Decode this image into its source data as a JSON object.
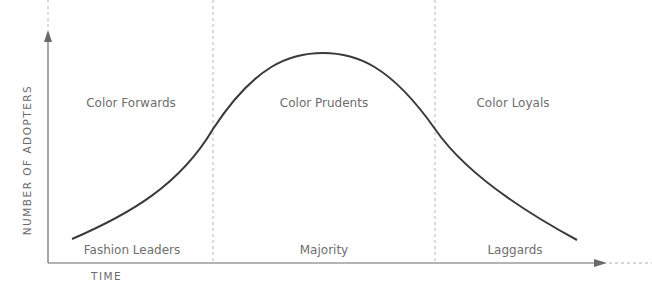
{
  "diagram": {
    "type": "bell-curve adoption diagram",
    "y_axis_label": "NUMBER OF ADOPTERS",
    "x_axis_label": "TIME",
    "segments": [
      {
        "top_label": "Color Forwards",
        "bottom_label": "Fashion Leaders"
      },
      {
        "top_label": "Color Prudents",
        "bottom_label": "Majority"
      },
      {
        "top_label": "Color Loyals",
        "bottom_label": "Laggards"
      }
    ],
    "colors": {
      "curve": "#3a3a3a",
      "axis": "#6a6a6a",
      "divider": "#b0b0b0",
      "text": "#6e6e6e"
    }
  }
}
